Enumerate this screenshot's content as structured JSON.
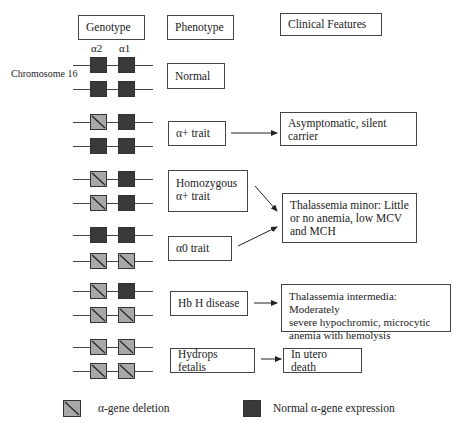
{
  "headers": {
    "genotype": "Genotype",
    "phenotype": "Phenotype",
    "clinical": "Clinical Features"
  },
  "gene_labels": {
    "alpha2": "α2",
    "alpha1": "α1"
  },
  "chromosome_label": "Chromosome 16",
  "rows": [
    {
      "phenotype": "Normal",
      "genes": [
        [
          "normal",
          "normal"
        ],
        [
          "normal",
          "normal"
        ]
      ]
    },
    {
      "phenotype": "α+ trait",
      "genes": [
        [
          "deleted",
          "normal"
        ],
        [
          "normal",
          "normal"
        ]
      ]
    },
    {
      "phenotype": "Homozygous α+ trait",
      "genes": [
        [
          "deleted",
          "normal"
        ],
        [
          "deleted",
          "normal"
        ]
      ]
    },
    {
      "phenotype": "α0 trait",
      "genes": [
        [
          "normal",
          "normal"
        ],
        [
          "deleted",
          "deleted"
        ]
      ]
    },
    {
      "phenotype": "Hb H disease",
      "genes": [
        [
          "deleted",
          "normal"
        ],
        [
          "deleted",
          "deleted"
        ]
      ]
    },
    {
      "phenotype": "Hydrops fetalis",
      "genes": [
        [
          "deleted",
          "deleted"
        ],
        [
          "deleted",
          "deleted"
        ]
      ]
    }
  ],
  "phenotypes": {
    "normal": "Normal",
    "alpha_plus": "α+ trait",
    "homozygous_line1": "Homozygous",
    "homozygous_line2": "α+ trait",
    "alpha_zero": "α0 trait",
    "hbh": "Hb H disease",
    "hydrops": "Hydrops fetalis"
  },
  "clinical": {
    "asymptomatic_line1": "Asymptomatic, silent",
    "asymptomatic_line2": "carrier",
    "minor_line1": "Thalassemia minor: Little",
    "minor_line2": "or no anemia, low MCV",
    "minor_line3": "and MCH",
    "intermedia_line1": "Thalassemia intermedia: Moderately",
    "intermedia_line2": "severe hypochromic, microcytic",
    "intermedia_line3": "anemia with hemolysis",
    "death": "In utero death"
  },
  "legend": {
    "deletion": "α-gene deletion",
    "normal": "Normal α-gene expression"
  },
  "colors": {
    "normal_gene": "#3a3a3a",
    "deleted_gene": "#a8a8a8",
    "line": "#444444"
  }
}
